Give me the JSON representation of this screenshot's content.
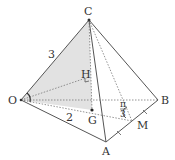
{
  "diagram": {
    "type": "tetrahedron",
    "points": {
      "C": {
        "label": "C",
        "x": 89,
        "y": 20
      },
      "O": {
        "label": "O",
        "x": 21,
        "y": 100
      },
      "B": {
        "label": "B",
        "x": 158,
        "y": 100
      },
      "A": {
        "label": "A",
        "x": 106,
        "y": 142
      },
      "H": {
        "label": "H",
        "x": 89,
        "y": 77
      },
      "G": {
        "label": "G",
        "x": 92,
        "y": 110
      },
      "M": {
        "label": "M",
        "x": 132,
        "y": 121
      }
    },
    "edge_labels": {
      "OC": "3",
      "OA": "2"
    },
    "angle_label": {
      "numerator": "π",
      "denominator": "3"
    },
    "colors": {
      "line": "#555555",
      "shade": "#dcdcdc",
      "text": "#333333"
    }
  }
}
